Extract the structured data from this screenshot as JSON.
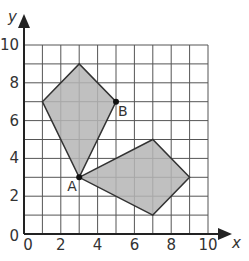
{
  "colors": {
    "grid": "#555555",
    "axis": "#222222",
    "fill": "#b5b5b5",
    "stroke": "#333333",
    "text": "#333333",
    "point": "#111111"
  },
  "axes": {
    "x_label": "x",
    "y_label": "y",
    "x_ticks": [
      "0",
      "2",
      "4",
      "6",
      "8",
      "10"
    ],
    "y_ticks": [
      "0",
      "2",
      "4",
      "6",
      "8",
      "10"
    ],
    "x_range": [
      0,
      10
    ],
    "y_range": [
      0,
      10
    ]
  },
  "points": {
    "A": {
      "label": "A",
      "x": 3,
      "y": 3
    },
    "B": {
      "label": "B",
      "x": 5,
      "y": 7
    }
  },
  "shapes": [
    {
      "name": "kite",
      "vertices": [
        [
          1,
          7
        ],
        [
          3,
          9
        ],
        [
          5,
          7
        ],
        [
          3,
          3
        ]
      ]
    },
    {
      "name": "quadrilateral",
      "vertices": [
        [
          3,
          3
        ],
        [
          7,
          5
        ],
        [
          9,
          3
        ],
        [
          7,
          1
        ]
      ]
    }
  ]
}
